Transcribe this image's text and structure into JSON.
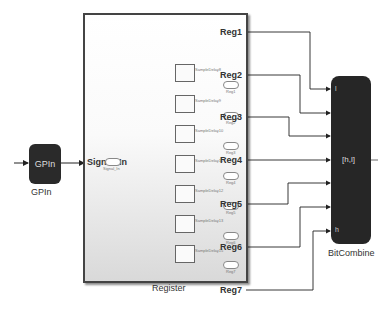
{
  "diagram": {
    "blocks": {
      "gpin": {
        "label": "GPIn",
        "caption": "GPIn"
      },
      "register": {
        "caption": "Register",
        "input_port": "Signal_In",
        "input_goto_tag": "Signal_In",
        "delays": [
          {
            "name": "SampleDelay8",
            "goto": "Reg1"
          },
          {
            "name": "SampleDelay9",
            "goto": "Reg2"
          },
          {
            "name": "SampleDelay10",
            "goto": "Reg3"
          },
          {
            "name": "SampleDelay11",
            "goto": "Reg4"
          },
          {
            "name": "SampleDelay12",
            "goto": "Reg5"
          },
          {
            "name": "SampleDelay13",
            "goto": "Reg6"
          },
          {
            "name": "SampleDelay15",
            "goto": "Reg7"
          }
        ],
        "output_ports": [
          "Reg1",
          "Reg2",
          "Reg3",
          "Reg4",
          "Reg5",
          "Reg6",
          "Reg7"
        ]
      },
      "bitcombine": {
        "caption": "BitCombine",
        "center_label": "[h,l]",
        "port_top": "l",
        "port_bottom": "h"
      }
    }
  }
}
